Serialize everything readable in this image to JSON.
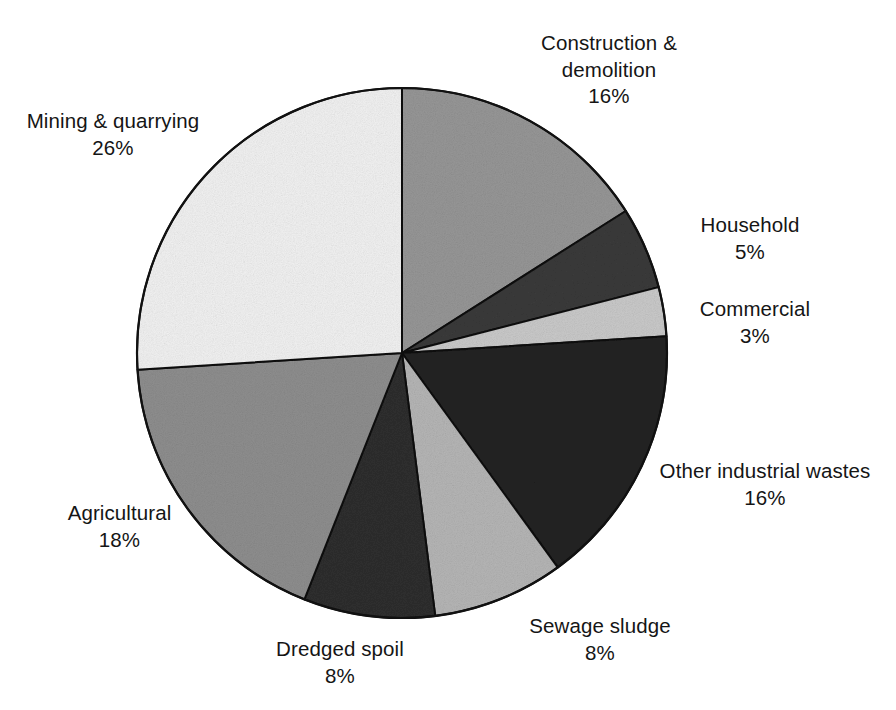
{
  "chart_data": {
    "type": "pie",
    "title": "",
    "subtitle": "",
    "unit": "%",
    "start_angle_deg": 0,
    "direction": "clockwise",
    "legend": "none",
    "labels_position": "outside",
    "categories": [
      "Construction & demolition",
      "Household",
      "Commercial",
      "Other industrial wastes",
      "Sewage sludge",
      "Dredged spoil",
      "Agricultural",
      "Mining & quarrying"
    ],
    "values": [
      16,
      5,
      3,
      16,
      8,
      8,
      18,
      26
    ],
    "slices": [
      {
        "name": "Construction & demolition",
        "label_line1": "Construction &",
        "label_line2": "demolition",
        "value": 16,
        "value_text": "16%",
        "color": "#969696",
        "start_deg": 0,
        "end_deg": 57.6
      },
      {
        "name": "Household",
        "label_line1": "Household",
        "label_line2": "",
        "value": 5,
        "value_text": "5%",
        "color": "#3a3a3a",
        "start_deg": 57.6,
        "end_deg": 75.6
      },
      {
        "name": "Commercial",
        "label_line1": "Commercial",
        "label_line2": "",
        "value": 3,
        "value_text": "3%",
        "color": "#c9c9c9",
        "start_deg": 75.6,
        "end_deg": 86.4
      },
      {
        "name": "Other industrial wastes",
        "label_line1": "Other industrial wastes",
        "label_line2": "",
        "value": 16,
        "value_text": "16%",
        "color": "#232323",
        "start_deg": 86.4,
        "end_deg": 144.0
      },
      {
        "name": "Sewage sludge",
        "label_line1": "Sewage sludge",
        "label_line2": "",
        "value": 8,
        "value_text": "8%",
        "color": "#b5b5b5",
        "start_deg": 144.0,
        "end_deg": 172.8
      },
      {
        "name": "Dredged spoil",
        "label_line1": "Dredged spoil",
        "label_line2": "",
        "value": 8,
        "value_text": "8%",
        "color": "#2e2e2e",
        "start_deg": 172.8,
        "end_deg": 201.6
      },
      {
        "name": "Agricultural",
        "label_line1": "Agricultural",
        "label_line2": "",
        "value": 18,
        "value_text": "18%",
        "color": "#8e8e8e",
        "start_deg": 201.6,
        "end_deg": 266.4
      },
      {
        "name": "Mining & quarrying",
        "label_line1": "Mining & quarrying",
        "label_line2": "",
        "value": 26,
        "value_text": "26%",
        "color": "#f1f1f1",
        "start_deg": 266.4,
        "end_deg": 360.0
      }
    ],
    "geometry": {
      "center_x": 402,
      "center_y": 353,
      "radius": 265
    },
    "outline_color": "#111111"
  },
  "labels": {
    "construction": {
      "name": "Construction &",
      "name2": "demolition",
      "value": "16%"
    },
    "mining": {
      "name": "Mining & quarrying",
      "value": "26%"
    },
    "household": {
      "name": "Household",
      "value": "5%"
    },
    "commercial": {
      "name": "Commercial",
      "value": "3%"
    },
    "other": {
      "name": "Other industrial wastes",
      "value": "16%"
    },
    "sewage": {
      "name": "Sewage sludge",
      "value": "8%"
    },
    "dredged": {
      "name": "Dredged spoil",
      "value": "8%"
    },
    "agricultural": {
      "name": "Agricultural",
      "value": "18%"
    }
  }
}
